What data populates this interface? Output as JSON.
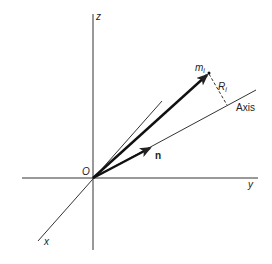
{
  "diagram": {
    "type": "3d-coordinate-vector-diagram",
    "labels": {
      "z_axis": "z",
      "y_axis": "y",
      "x_axis": "x",
      "origin": "O",
      "mass_point": "m",
      "mass_subscript": "i",
      "distance": "R",
      "distance_subscript": "i",
      "axis": "Axis",
      "unit_vector": "n"
    },
    "colors": {
      "line": "#222222",
      "background": "#ffffff"
    }
  }
}
